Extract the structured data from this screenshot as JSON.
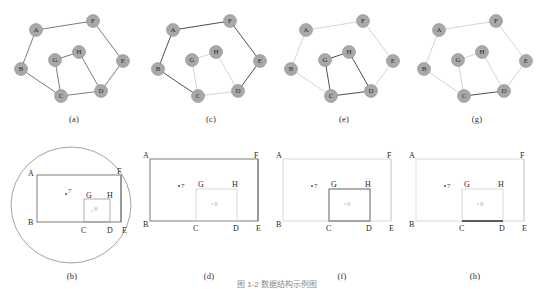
{
  "figure": {
    "caption": "图 1-2  数据结构示例图",
    "panels": [
      {
        "id": "a",
        "label": "(a)",
        "type": "graph"
      },
      {
        "id": "c",
        "label": "(c)",
        "type": "graph"
      },
      {
        "id": "e",
        "label": "(e)",
        "type": "graph"
      },
      {
        "id": "g",
        "label": "(g)",
        "type": "graph"
      },
      {
        "id": "b",
        "label": "(b)",
        "type": "region"
      },
      {
        "id": "d",
        "label": "(d)",
        "type": "region"
      },
      {
        "id": "f",
        "label": "(f)",
        "type": "region"
      },
      {
        "id": "h",
        "label": "(h)",
        "type": "region"
      }
    ]
  },
  "graph": {
    "nodes": [
      {
        "id": "A",
        "label": "A",
        "x": 28,
        "y": 24
      },
      {
        "id": "B",
        "label": "B",
        "x": 13,
        "y": 63
      },
      {
        "id": "C",
        "label": "C",
        "x": 53,
        "y": 90
      },
      {
        "id": "D",
        "label": "D",
        "x": 93,
        "y": 85
      },
      {
        "id": "E",
        "label": "E",
        "x": 115,
        "y": 55
      },
      {
        "id": "F",
        "label": "F",
        "x": 85,
        "y": 15
      },
      {
        "id": "G",
        "label": "G",
        "x": 47,
        "y": 54
      },
      {
        "id": "H",
        "label": "H",
        "x": 71,
        "y": 46
      }
    ],
    "edges": [
      {
        "from": "A",
        "to": "B"
      },
      {
        "from": "A",
        "to": "F"
      },
      {
        "from": "B",
        "to": "C"
      },
      {
        "from": "C",
        "to": "D"
      },
      {
        "from": "C",
        "to": "G"
      },
      {
        "from": "D",
        "to": "E"
      },
      {
        "from": "D",
        "to": "H"
      },
      {
        "from": "E",
        "to": "F"
      },
      {
        "from": "G",
        "to": "H"
      }
    ],
    "node_fill": "#a8a8a8",
    "node_stroke": "#8f8f8f",
    "edge_color": "#5a5a5a",
    "edge_color_faint": "#c9c9c9",
    "edge_color_dark": "#3a3a3a",
    "highlight": {
      "a": [],
      "c": [
        [
          "A",
          "B"
        ],
        [
          "B",
          "C"
        ],
        [
          "C",
          "G"
        ],
        [
          "C",
          "D"
        ],
        [
          "D",
          "H"
        ],
        [
          "A",
          "F"
        ],
        [
          "E",
          "F"
        ],
        [
          "D",
          "E"
        ]
      ],
      "e": [
        [
          "G",
          "H"
        ],
        [
          "H",
          "D"
        ],
        [
          "C",
          "D"
        ],
        [
          "C",
          "G"
        ]
      ],
      "g": []
    }
  },
  "region": {
    "vertices": [
      {
        "id": "A",
        "label": "A"
      },
      {
        "id": "B",
        "label": "B"
      },
      {
        "id": "C",
        "label": "C"
      },
      {
        "id": "D",
        "label": "D"
      },
      {
        "id": "E",
        "label": "E"
      },
      {
        "id": "F",
        "label": "F"
      },
      {
        "id": "G",
        "label": "G"
      },
      {
        "id": "H",
        "label": "H"
      }
    ],
    "point_markers": [
      {
        "id": "p7",
        "label": "7"
      },
      {
        "id": "p8",
        "label": "8"
      }
    ],
    "line_color": "#6e6e6e",
    "line_color_faint": "#d2d2d2",
    "line_color_dark": "#2f2f2f",
    "ellipse_color": "#8a8a8a"
  }
}
